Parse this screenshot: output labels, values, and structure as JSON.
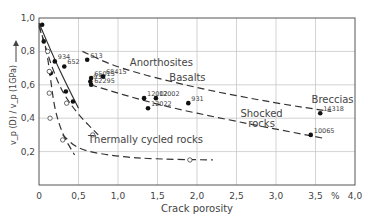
{
  "chart_data": {
    "type": "scatter",
    "title": "",
    "xlabel": "Crack porosity",
    "x_unit": "%",
    "ylabel": "v_p (D) / v_p (1GPa)",
    "xlim": [
      0,
      4.0
    ],
    "ylim": [
      0,
      1.0
    ],
    "x_ticks": [
      "0",
      "0,5",
      "1,0",
      "1,5",
      "2,0",
      "2,5",
      "3,0",
      "3,5",
      "4,0"
    ],
    "y_ticks": [
      "0,2",
      "0,4",
      "0,6",
      "0,8",
      "1,0"
    ],
    "grid": true,
    "series": [
      {
        "name": "Lunar samples (solid)",
        "marker": "filled-circle",
        "points": [
          {
            "x": 0.04,
            "y": 0.96,
            "label": ""
          },
          {
            "x": 0.06,
            "y": 0.86,
            "label": ""
          },
          {
            "x": 0.2,
            "y": 0.74,
            "label": "934"
          },
          {
            "x": 0.15,
            "y": 0.67,
            "label": ""
          },
          {
            "x": 0.32,
            "y": 0.71,
            "label": "652"
          },
          {
            "x": 0.34,
            "y": 0.56,
            "label": ""
          },
          {
            "x": 0.43,
            "y": 0.5,
            "label": ""
          },
          {
            "x": 0.61,
            "y": 0.75,
            "label": "613"
          },
          {
            "x": 0.66,
            "y": 0.64,
            "label": "65015"
          },
          {
            "x": 0.65,
            "y": 0.62,
            "label": "938"
          },
          {
            "x": 0.66,
            "y": 0.6,
            "label": "62295"
          },
          {
            "x": 0.81,
            "y": 0.65,
            "label": "68415"
          },
          {
            "x": 1.33,
            "y": 0.52,
            "label": "12002"
          },
          {
            "x": 1.48,
            "y": 0.52,
            "label": "12002"
          },
          {
            "x": 1.38,
            "y": 0.46,
            "label": "12022"
          },
          {
            "x": 1.89,
            "y": 0.49,
            "label": "931"
          },
          {
            "x": 3.56,
            "y": 0.43,
            "label": "14318"
          },
          {
            "x": 3.44,
            "y": 0.3,
            "label": "10065"
          }
        ]
      },
      {
        "name": "Thermally cycled rocks (open)",
        "marker": "open-circle",
        "points": [
          {
            "x": 0.11,
            "y": 0.8
          },
          {
            "x": 0.13,
            "y": 0.68
          },
          {
            "x": 0.13,
            "y": 0.55
          },
          {
            "x": 0.35,
            "y": 0.49
          },
          {
            "x": 0.14,
            "y": 0.4
          },
          {
            "x": 0.68,
            "y": 0.3
          },
          {
            "x": 0.3,
            "y": 0.27
          },
          {
            "x": 1.91,
            "y": 0.15
          }
        ]
      }
    ],
    "curves": [
      {
        "name": "solid-trend",
        "style": "solid",
        "points": [
          [
            0.0,
            0.97
          ],
          [
            0.2,
            0.75
          ],
          [
            0.35,
            0.6
          ],
          [
            0.5,
            0.46
          ]
        ]
      },
      {
        "name": "thermal-steep",
        "style": "dashed",
        "points": [
          [
            0.0,
            0.95
          ],
          [
            0.1,
            0.8
          ],
          [
            0.15,
            0.62
          ],
          [
            0.2,
            0.45
          ],
          [
            0.3,
            0.3
          ],
          [
            0.45,
            0.18
          ]
        ]
      },
      {
        "name": "thermal-mid",
        "style": "dashed",
        "points": [
          [
            0.0,
            0.96
          ],
          [
            0.15,
            0.72
          ],
          [
            0.3,
            0.55
          ],
          [
            0.5,
            0.42
          ],
          [
            0.75,
            0.3
          ]
        ]
      },
      {
        "name": "thermal-low",
        "style": "dashed",
        "points": [
          [
            0.3,
            0.3
          ],
          [
            0.5,
            0.21
          ],
          [
            1.0,
            0.17
          ],
          [
            1.5,
            0.155
          ],
          [
            2.2,
            0.15
          ]
        ]
      },
      {
        "name": "anorthosites",
        "style": "dashed",
        "points": [
          [
            0.55,
            0.8
          ],
          [
            1.0,
            0.7
          ],
          [
            2.0,
            0.58
          ],
          [
            3.0,
            0.49
          ],
          [
            3.7,
            0.44
          ]
        ]
      },
      {
        "name": "basalts-shocked",
        "style": "dashed",
        "points": [
          [
            0.65,
            0.6
          ],
          [
            1.5,
            0.48
          ],
          [
            2.5,
            0.38
          ],
          [
            3.6,
            0.28
          ]
        ]
      }
    ],
    "annotations": [
      {
        "text": "Anorthosites",
        "x": 1.15,
        "y": 0.71
      },
      {
        "text": "Basalts",
        "x": 1.65,
        "y": 0.62
      },
      {
        "text": "Shocked",
        "x": 2.55,
        "y": 0.41
      },
      {
        "text": "rocks",
        "x": 2.65,
        "y": 0.35
      },
      {
        "text": "Breccias",
        "x": 3.45,
        "y": 0.49
      },
      {
        "text": "Thermally cycled rocks",
        "x": 0.62,
        "y": 0.25
      }
    ]
  }
}
